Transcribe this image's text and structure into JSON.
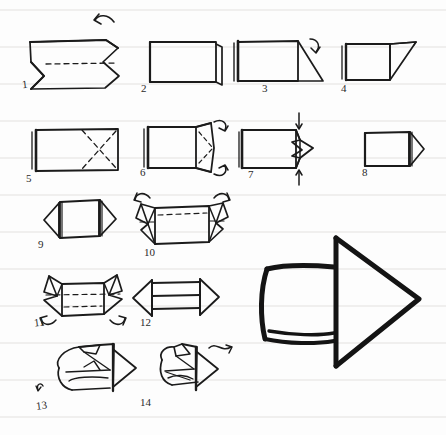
{
  "document": {
    "title": "Origami Arrow Folding Instructions",
    "medium": "hand-drawn pencil sketch on ruled notebook paper",
    "subject": "paper arrow (double-headed arrow / 3D arrow)",
    "total_steps": 14,
    "background_color": "#fdfdfd",
    "rule_line_color": "#f0f0f0",
    "ink_color": "#1b1b1b"
  },
  "paper": {
    "ruled_line_spacing_px": 37,
    "ruled_line_offset_px": 10,
    "ruled_line_count": 12
  },
  "steps": [
    {
      "number": "1",
      "label_x": 22,
      "label_y": 84,
      "description": "Rectangle with inward V notch on left side and point on right; horizontal dashed valley fold through the middle; curved arrow above indicating fold up",
      "has_dashed_fold": true,
      "has_arrow": true,
      "arrow_type": "curved-left"
    },
    {
      "number": "2",
      "label_x": 141,
      "label_y": 88,
      "description": "Plain folded rectangle seen from the side with a layered edge on the right",
      "has_dashed_fold": false,
      "has_arrow": false,
      "arrow_type": "none"
    },
    {
      "number": "3",
      "label_x": 262,
      "label_y": 88,
      "description": "Rectangle with a triangular flap extending to the lower right; small curved arrow above the flap",
      "has_dashed_fold": false,
      "has_arrow": true,
      "arrow_type": "curved-right"
    },
    {
      "number": "4",
      "label_x": 341,
      "label_y": 88,
      "description": "Square with a triangular flap folded up to the upper right",
      "has_dashed_fold": false,
      "has_arrow": false,
      "arrow_type": "none"
    },
    {
      "number": "5",
      "label_x": 26,
      "label_y": 183,
      "description": "Rectangle with both dashed diagonals forming an X (crease pattern)",
      "has_dashed_fold": true,
      "has_arrow": false,
      "arrow_type": "none"
    },
    {
      "number": "6",
      "label_x": 140,
      "label_y": 177,
      "description": "Rectangle with right end opened into a diamond flap with dashed creases; two curved arrows at upper and lower right",
      "has_dashed_fold": true,
      "has_arrow": true,
      "arrow_type": "curved-pair"
    },
    {
      "number": "7",
      "label_x": 248,
      "label_y": 180,
      "description": "Rectangle with arrow-point tip on right formed from folded flaps; straight arrows pointing down from above and up from below",
      "has_dashed_fold": false,
      "has_arrow": true,
      "arrow_type": "straight-pair"
    },
    {
      "number": "8",
      "label_x": 362,
      "label_y": 178,
      "description": "Clean rectangle with a finished triangular arrow point on the right side",
      "has_dashed_fold": false,
      "has_arrow": false,
      "arrow_type": "none"
    },
    {
      "number": "9",
      "label_x": 38,
      "label_y": 242,
      "description": "Shape with triangular points at both left and right ends (double point)",
      "has_dashed_fold": false,
      "has_arrow": false,
      "arrow_type": "none"
    },
    {
      "number": "10",
      "label_x": 144,
      "label_y": 250,
      "description": "Double-pointed shape with horizontal dashed fold lines; curved arrows at both upper corners indicating folds back",
      "has_dashed_fold": true,
      "has_arrow": true,
      "arrow_type": "curved-pair-top"
    },
    {
      "number": "11",
      "label_x": 34,
      "label_y": 322,
      "description": "Shape with raised folded tips at both ends and horizontal dashed folds; curved arrows at both lower corners",
      "has_dashed_fold": true,
      "has_arrow": true,
      "arrow_type": "curved-pair-bottom"
    },
    {
      "number": "12",
      "label_x": 140,
      "label_y": 320,
      "description": "Flat double-headed arrow with two horizontal bars across the shaft",
      "has_dashed_fold": false,
      "has_arrow": false,
      "arrow_type": "none"
    },
    {
      "number": "13",
      "label_x": 36,
      "label_y": 409,
      "description": "Three-quarter view of the arrow being opened into a 3D form; small curl arrow at lower left",
      "has_dashed_fold": false,
      "has_arrow": true,
      "arrow_type": "curl-small"
    },
    {
      "number": "14",
      "label_x": 140,
      "label_y": 404,
      "description": "Three-quarter view of the shaped 3D arrow; wavy arrow at upper right pointing to the finished model",
      "has_dashed_fold": false,
      "has_arrow": true,
      "arrow_type": "wavy-right"
    }
  ],
  "final_model": {
    "name": "finished-3d-arrow",
    "description": "Large bold three-dimensional arrow pointing right, drawn with thick outlines, shown as the completed model",
    "stroke_width": 5,
    "position": {
      "x": 258,
      "y": 232,
      "width": 180,
      "height": 140
    }
  }
}
